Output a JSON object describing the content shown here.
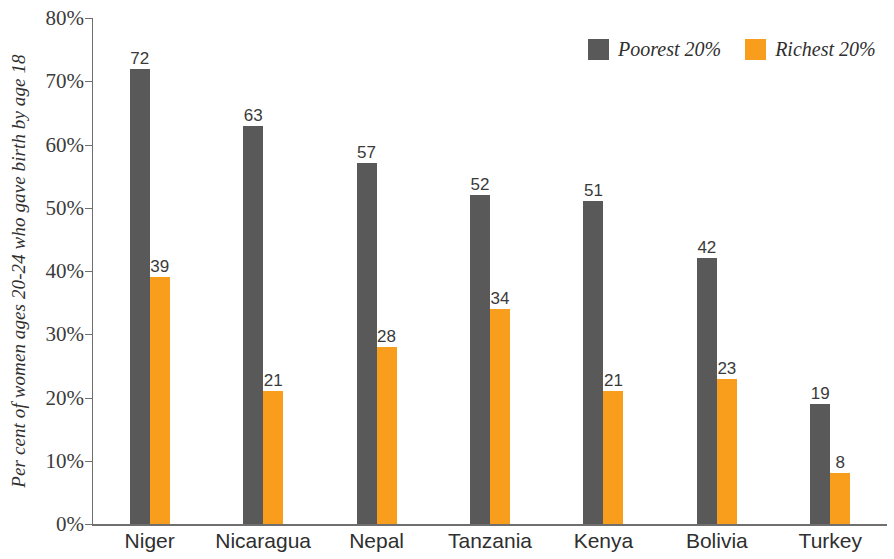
{
  "chart_data": {
    "type": "bar",
    "title": "",
    "subtitle": "",
    "xlabel": "",
    "ylabel": "Per cent of women ages 20-24 who gave birth by age 18",
    "ylim": [
      0,
      80
    ],
    "ytick_step": 10,
    "ytick_labels": [
      "0%",
      "10%",
      "20%",
      "30%",
      "40%",
      "50%",
      "60%",
      "70%",
      "80%"
    ],
    "ytick_values": [
      0,
      10,
      20,
      30,
      40,
      50,
      60,
      70,
      80
    ],
    "grid": false,
    "legend_position": "top-right",
    "categories": [
      "Niger",
      "Nicaragua",
      "Nepal",
      "Tanzania",
      "Kenya",
      "Bolivia",
      "Turkey"
    ],
    "series": [
      {
        "name": "Poorest 20%",
        "color": "#595959",
        "values": [
          72,
          63,
          57,
          52,
          51,
          42,
          19
        ]
      },
      {
        "name": "Richest 20%",
        "color": "#F99D1C",
        "values": [
          39,
          21,
          28,
          34,
          21,
          23,
          8
        ]
      }
    ],
    "value_labels_shown": true,
    "axis_color": "#6f6f6f",
    "background_color": "#ffffff"
  },
  "legend": {
    "items": [
      {
        "label": "Poorest 20%",
        "color": "#595959",
        "swatch_name": "legend-swatch-poorest"
      },
      {
        "label": "Richest 20%",
        "color": "#F99D1C",
        "swatch_name": "legend-swatch-richest"
      }
    ]
  }
}
